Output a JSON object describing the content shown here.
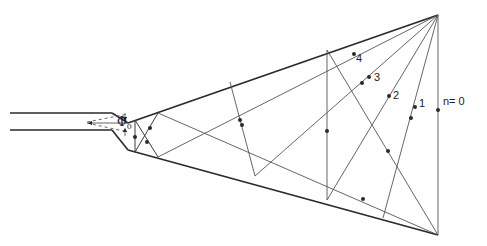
{
  "figure": {
    "colors": {
      "line": "#2a2a2a",
      "ray": "#555555",
      "background": "#ffffff"
    }
  },
  "labels": {
    "n0": "n= 0",
    "n1": "1",
    "n2": "2",
    "n3": "3",
    "n4": "4",
    "phi": "Φ",
    "phi_sub": "0"
  },
  "geometry": {
    "apex": [
      438,
      15
    ],
    "bottom_vertex": [
      438,
      235
    ],
    "throat_top": [
      128,
      123
    ],
    "throat_bottom": [
      128,
      150
    ],
    "waveguide_top_y": 113,
    "waveguide_bottom_y": 130,
    "ray_families": [
      {
        "n": 0,
        "label_pos": [
          442,
          101
        ]
      },
      {
        "n": 1,
        "label_pos": [
          419,
          102
        ]
      },
      {
        "n": 2,
        "label_pos": [
          393,
          93
        ]
      },
      {
        "n": 3,
        "label_pos": [
          374,
          76
        ]
      },
      {
        "n": 4,
        "label_pos": [
          356,
          56
        ]
      }
    ]
  }
}
